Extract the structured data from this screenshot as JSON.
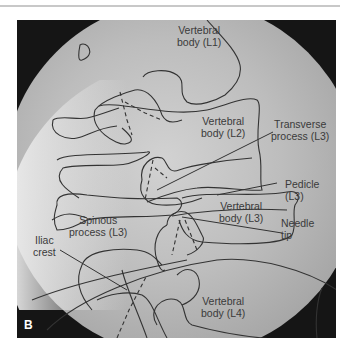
{
  "figure": {
    "panel_letter": "B",
    "labels": {
      "l1": [
        "Vertebral",
        "body (L1)"
      ],
      "l2": [
        "Vertebral",
        "body (L2)"
      ],
      "transverse": [
        "Transverse",
        "process (L3)"
      ],
      "pedicle": [
        "Pedicle",
        "(L3)"
      ],
      "l3": [
        "Vertebral",
        "body (L3)"
      ],
      "needle": [
        "Needle",
        "tip"
      ],
      "spinous": [
        "Spinous",
        "process (L3)"
      ],
      "iliac": [
        "Iliac",
        "crest"
      ],
      "l4": [
        "Vertebral",
        "body (L4)"
      ]
    },
    "colors": {
      "background_dark": "#111111",
      "field": "#b9b9b9",
      "outline": "#333333"
    }
  }
}
